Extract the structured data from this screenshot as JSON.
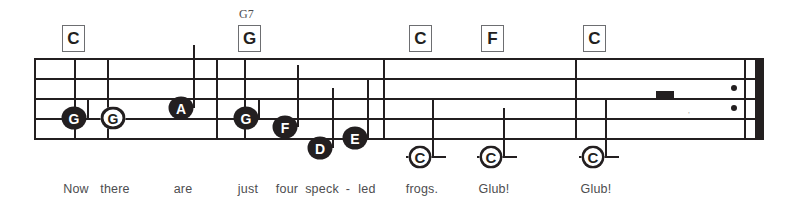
{
  "sheet": {
    "title": "Now there are just four speck-led frogs. Glub! Glub!",
    "ink_color": "#231f20",
    "line_color": "#6d6e71",
    "lyric_color": "#4d4d4f"
  },
  "staff": {
    "left": 34,
    "right": 764,
    "line_y": [
      58,
      78,
      98,
      118,
      138
    ],
    "line_thickness": 2
  },
  "barlines": [
    {
      "name": "barline-1",
      "x": 34,
      "top": 58,
      "bottom": 138
    },
    {
      "name": "barline-2",
      "x": 74,
      "top": 58,
      "bottom": 138
    },
    {
      "name": "barline-3",
      "x": 107,
      "top": 58,
      "bottom": 138
    },
    {
      "name": "barline-4",
      "x": 216,
      "top": 58,
      "bottom": 138
    },
    {
      "name": "barline-5",
      "x": 244,
      "top": 58,
      "bottom": 138
    },
    {
      "name": "barline-6",
      "x": 383,
      "top": 58,
      "bottom": 138
    },
    {
      "name": "barline-7",
      "x": 575,
      "top": 58,
      "bottom": 138
    }
  ],
  "repeat_end": {
    "thin_x": 744,
    "thick_x": 755,
    "top": 58,
    "bottom": 138,
    "dot_upper_y": 88,
    "dot_lower_y": 108,
    "dot_x": 731
  },
  "chords": [
    {
      "name": "chord-c-1",
      "label": "C",
      "sup": "",
      "x": 62,
      "y": 25
    },
    {
      "name": "chord-g7",
      "label": "G",
      "sup": "G7",
      "x": 238,
      "y": 25,
      "sup_x": 239,
      "sup_y": 7
    },
    {
      "name": "chord-c-2",
      "label": "C",
      "x": 409,
      "y": 25
    },
    {
      "name": "chord-f",
      "label": "F",
      "x": 481,
      "y": 25
    },
    {
      "name": "chord-c-3",
      "label": "C",
      "x": 583,
      "y": 25
    }
  ],
  "notes": [
    {
      "name": "note-g-1",
      "pitch": "G",
      "style": "filled",
      "x": 74,
      "y": 118,
      "stem": {
        "x": 87,
        "top": 98,
        "bottom": 118
      }
    },
    {
      "name": "note-g-2",
      "pitch": "G",
      "style": "hollow",
      "x": 113,
      "y": 118,
      "stem": null
    },
    {
      "name": "note-a-1",
      "pitch": "A",
      "style": "filled",
      "x": 181,
      "y": 108,
      "stem": {
        "x": 193,
        "top": 45,
        "bottom": 108
      }
    },
    {
      "name": "note-g-3",
      "pitch": "G",
      "style": "filled",
      "x": 246,
      "y": 118,
      "stem": {
        "x": 258,
        "top": 98,
        "bottom": 118
      }
    },
    {
      "name": "note-f-1",
      "pitch": "F",
      "style": "filled",
      "x": 285,
      "y": 127,
      "stem": {
        "x": 297,
        "top": 65,
        "bottom": 127
      }
    },
    {
      "name": "note-d-1",
      "pitch": "D",
      "style": "filled",
      "x": 320,
      "y": 148,
      "stem": {
        "x": 332,
        "top": 88,
        "bottom": 148
      }
    },
    {
      "name": "note-e-1",
      "pitch": "E",
      "style": "filled",
      "x": 355,
      "y": 138,
      "stem": {
        "x": 367,
        "top": 78,
        "bottom": 138
      }
    }
  ],
  "low_c_notes": [
    {
      "name": "note-c-low-1",
      "pitch": "C",
      "x": 420,
      "y": 157,
      "ledger_width": 40,
      "stem": {
        "x": 432,
        "top": 98,
        "bottom": 157
      }
    },
    {
      "name": "note-c-low-2",
      "pitch": "C",
      "x": 491,
      "y": 157,
      "ledger_width": 40,
      "stem": {
        "x": 503,
        "top": 108,
        "bottom": 157
      }
    },
    {
      "name": "note-c-low-3",
      "pitch": "C",
      "x": 593,
      "y": 157,
      "ledger_width": 40,
      "stem": {
        "x": 605,
        "top": 98,
        "bottom": 157
      }
    }
  ],
  "rests": [
    {
      "name": "half-rest",
      "type": "half",
      "x": 665,
      "y": 98,
      "width": 18,
      "height": 8
    }
  ],
  "lyrics": [
    {
      "name": "lyric-now",
      "text": "Now",
      "x": 76
    },
    {
      "name": "lyric-there",
      "text": "there",
      "x": 115
    },
    {
      "name": "lyric-are",
      "text": "are",
      "x": 183
    },
    {
      "name": "lyric-just",
      "text": "just",
      "x": 248
    },
    {
      "name": "lyric-four",
      "text": "four",
      "x": 287
    },
    {
      "name": "lyric-speck",
      "text": "speck",
      "x": 322
    },
    {
      "name": "lyric-hyphen",
      "text": "-",
      "x": 348
    },
    {
      "name": "lyric-led",
      "text": "led",
      "x": 367
    },
    {
      "name": "lyric-frogs",
      "text": "frogs.",
      "x": 422
    },
    {
      "name": "lyric-glub-1",
      "text": "Glub!",
      "x": 494
    },
    {
      "name": "lyric-glub-2",
      "text": "Glub!",
      "x": 596
    }
  ],
  "lyrics_y": 182,
  "artifact": {
    "name": "scan-smudge",
    "text": "’",
    "x": 688,
    "y": 110
  }
}
